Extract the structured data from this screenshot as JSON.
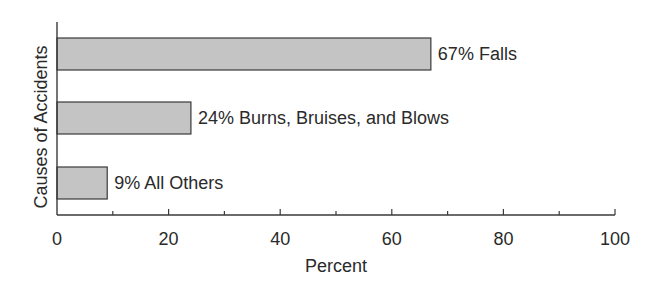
{
  "chart_data": {
    "type": "bar",
    "orientation": "horizontal",
    "title": "",
    "xlabel": "Percent",
    "ylabel": "Causes of Accidents",
    "categories": [
      "Falls",
      "Burns, Bruises, and Blows",
      "All Others"
    ],
    "values": [
      67,
      24,
      9
    ],
    "bar_labels": [
      "67% Falls",
      "24% Burns, Bruises, and Blows",
      "9% All Others"
    ],
    "xlim": [
      0,
      100
    ],
    "xticks_major": [
      0,
      20,
      40,
      60,
      80,
      100
    ],
    "xtick_labels": [
      "0",
      "20",
      "40",
      "60",
      "80",
      "100"
    ],
    "xticks_minor": [
      10,
      30,
      50,
      70,
      90
    ],
    "grid": false,
    "legend": "none",
    "colors": {
      "bar_fill": "#c4c4c4",
      "bar_stroke": "#3a3a3a",
      "axis": "#3a3a3a",
      "text": "#2a2a2a"
    }
  }
}
